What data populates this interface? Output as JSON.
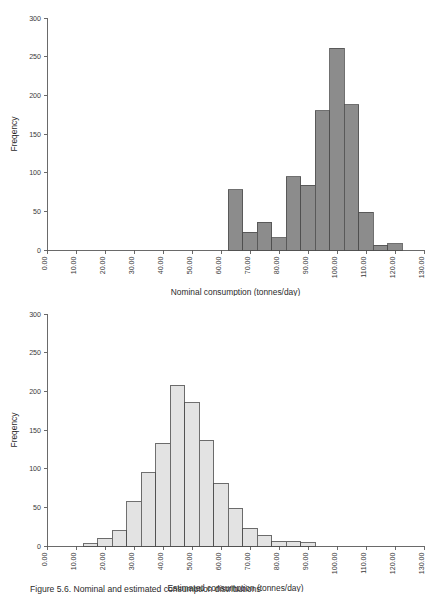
{
  "figure": {
    "caption": "Figure 5.6. Nominal and estimated consumption distributions",
    "background": "#ffffff"
  },
  "chart_data": [
    {
      "id": "nominal",
      "type": "bar",
      "subtype": "histogram",
      "title": "",
      "xlabel": "Nominal consumption (tonnes/day)",
      "ylabel": "Freqency",
      "xlim": [
        0,
        130
      ],
      "ylim": [
        0,
        300
      ],
      "xticks": [
        "0.00",
        "10.00",
        "20.00",
        "30.00",
        "40.00",
        "50.00",
        "60.00",
        "70.00",
        "80.00",
        "90.00",
        "100.00",
        "110.00",
        "120.00",
        "130.00"
      ],
      "xtick_values": [
        0,
        10,
        20,
        30,
        40,
        50,
        60,
        70,
        80,
        90,
        100,
        110,
        120,
        130
      ],
      "yticks": [
        "0",
        "50",
        "100",
        "150",
        "200",
        "250",
        "300"
      ],
      "ytick_values": [
        0,
        50,
        100,
        150,
        200,
        250,
        300
      ],
      "bin_width": 5,
      "grid": false,
      "legend": "none",
      "bar_color": "#8c8c8c",
      "bar_edge_color": "#4c4c4c",
      "bins": [
        {
          "x0": 62.5,
          "x1": 67.5,
          "value": 78
        },
        {
          "x0": 67.5,
          "x1": 72.5,
          "value": 23
        },
        {
          "x0": 72.5,
          "x1": 77.5,
          "value": 36
        },
        {
          "x0": 77.5,
          "x1": 82.5,
          "value": 16
        },
        {
          "x0": 82.5,
          "x1": 87.5,
          "value": 95
        },
        {
          "x0": 87.5,
          "x1": 92.5,
          "value": 84
        },
        {
          "x0": 92.5,
          "x1": 97.5,
          "value": 180
        },
        {
          "x0": 97.5,
          "x1": 102.5,
          "value": 261
        },
        {
          "x0": 102.5,
          "x1": 107.5,
          "value": 188
        },
        {
          "x0": 107.5,
          "x1": 112.5,
          "value": 49
        },
        {
          "x0": 112.5,
          "x1": 117.5,
          "value": 6
        },
        {
          "x0": 117.5,
          "x1": 122.5,
          "value": 8
        }
      ]
    },
    {
      "id": "estimated",
      "type": "bar",
      "subtype": "histogram",
      "title": "",
      "xlabel": "Estimated consumption (tonnes/day)",
      "ylabel": "Freqency",
      "xlim": [
        0,
        130
      ],
      "ylim": [
        0,
        300
      ],
      "xticks": [
        "0.00",
        "10.00",
        "20.00",
        "30.00",
        "40.00",
        "50.00",
        "60.00",
        "70.00",
        "80.00",
        "90.00",
        "100.00",
        "110.00",
        "120.00",
        "130.00"
      ],
      "xtick_values": [
        0,
        10,
        20,
        30,
        40,
        50,
        60,
        70,
        80,
        90,
        100,
        110,
        120,
        130
      ],
      "yticks": [
        "0",
        "50",
        "100",
        "150",
        "200",
        "250",
        "300"
      ],
      "ytick_values": [
        0,
        50,
        100,
        150,
        200,
        250,
        300
      ],
      "bin_width": 5,
      "grid": false,
      "legend": "none",
      "bar_color": "#e3e3e3",
      "bar_edge_color": "#6a6a6a",
      "bins": [
        {
          "x0": 12.5,
          "x1": 17.5,
          "value": 3
        },
        {
          "x0": 17.5,
          "x1": 22.5,
          "value": 10
        },
        {
          "x0": 22.5,
          "x1": 27.5,
          "value": 20
        },
        {
          "x0": 27.5,
          "x1": 32.5,
          "value": 57
        },
        {
          "x0": 32.5,
          "x1": 37.5,
          "value": 95
        },
        {
          "x0": 37.5,
          "x1": 42.5,
          "value": 133
        },
        {
          "x0": 42.5,
          "x1": 47.5,
          "value": 208
        },
        {
          "x0": 47.5,
          "x1": 52.5,
          "value": 185
        },
        {
          "x0": 52.5,
          "x1": 57.5,
          "value": 137
        },
        {
          "x0": 57.5,
          "x1": 62.5,
          "value": 81
        },
        {
          "x0": 62.5,
          "x1": 67.5,
          "value": 49
        },
        {
          "x0": 67.5,
          "x1": 72.5,
          "value": 23
        },
        {
          "x0": 72.5,
          "x1": 77.5,
          "value": 14
        },
        {
          "x0": 77.5,
          "x1": 82.5,
          "value": 6
        },
        {
          "x0": 82.5,
          "x1": 87.5,
          "value": 6
        },
        {
          "x0": 87.5,
          "x1": 92.5,
          "value": 4
        }
      ]
    }
  ]
}
